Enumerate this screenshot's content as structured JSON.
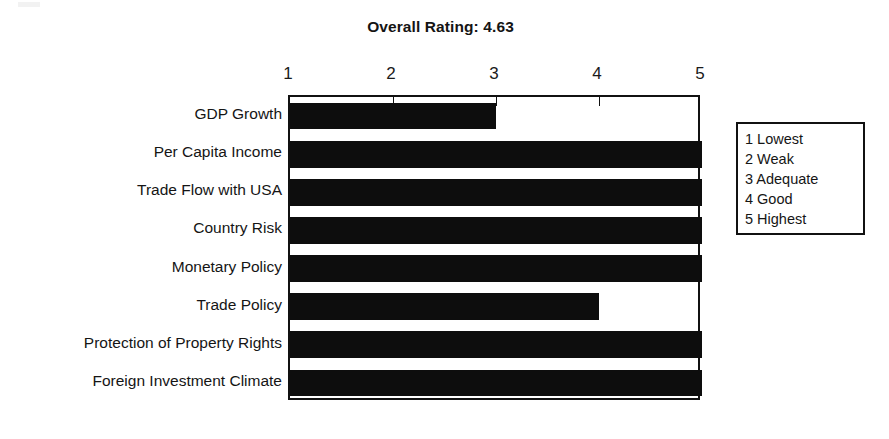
{
  "chart_data": {
    "type": "bar",
    "orientation": "horizontal",
    "title": "Overall Rating: 4.63",
    "xlabel": "",
    "ylabel": "",
    "xlim": [
      1,
      5
    ],
    "grid": false,
    "tick_labels": [
      "1",
      "2",
      "3",
      "4",
      "5"
    ],
    "tick_values": [
      1,
      2,
      3,
      4,
      5
    ],
    "axis_position": "top",
    "bar_color": "#0d0d0d",
    "categories": [
      "GDP Growth",
      "Per Capita Income",
      "Trade Flow with USA",
      "Country Risk",
      "Monetary Policy",
      "Trade Policy",
      "Protection of Property Rights",
      "Foreign Investment Climate"
    ],
    "values": [
      3,
      5,
      5,
      5,
      5,
      4,
      5,
      5
    ],
    "legend_position": "right-outside",
    "legend_entries": [
      "1 Lowest",
      "2 Weak",
      "3 Adequate",
      "4 Good",
      "5 Highest"
    ]
  },
  "title": {
    "text": "Overall Rating: 4.63"
  },
  "legend": {
    "items": [
      {
        "label": "1 Lowest"
      },
      {
        "label": "2 Weak"
      },
      {
        "label": "3 Adequate"
      },
      {
        "label": "4 Good"
      },
      {
        "label": "5 Highest"
      }
    ]
  },
  "colors": {
    "bar": "#0d0d0d",
    "border": "#111111",
    "background": "#ffffff",
    "text": "#151515"
  }
}
